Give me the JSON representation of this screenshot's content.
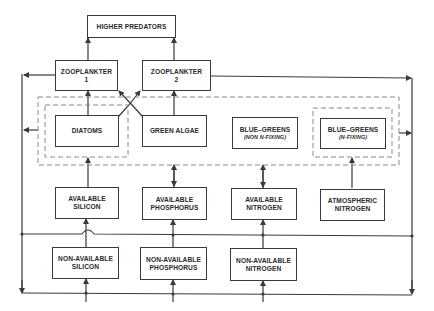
{
  "diagram": {
    "colors": {
      "line": "#3a3a3a",
      "dash": "#8a8a8a",
      "text": "#2a2a2a",
      "background": "#ffffff"
    },
    "nodes": {
      "higher_predators": {
        "label": "HIGHER PREDATORS"
      },
      "zooplankter_1": {
        "line1": "ZOOPLANKTER",
        "line2": "1"
      },
      "zooplankter_2": {
        "line1": "ZOOPLANKTER",
        "line2": "2"
      },
      "diatoms": {
        "label": "DIATOMS"
      },
      "green_algae": {
        "label": "GREEN ALGAE"
      },
      "blue_greens_non_fixing": {
        "line1": "BLUE–GREENS",
        "line2": "(NON N-FIXING)"
      },
      "blue_greens_fixing": {
        "line1": "BLUE–GREENS",
        "line2": "(N-FIXING)"
      },
      "available_silicon": {
        "line1": "AVAILABLE",
        "line2": "SILICON"
      },
      "available_phosphorus": {
        "line1": "AVAILABLE",
        "line2": "PHOSPHORUS"
      },
      "available_nitrogen": {
        "line1": "AVAILABLE",
        "line2": "NITROGEN"
      },
      "atmospheric_nitrogen": {
        "line1": "ATMOSPHERIC",
        "line2": "NITROGEN"
      },
      "non_available_silicon": {
        "line1": "NON-AVAILABLE",
        "line2": "SILICON"
      },
      "non_available_phosphorus": {
        "line1": "NON-AVAILABLE",
        "line2": "PHOSPHORUS"
      },
      "non_available_nitrogen": {
        "line1": "NON-AVAILABLE",
        "line2": "NITROGEN"
      }
    },
    "groups": [
      {
        "name": "phytoplankton-group",
        "members": [
          "diatoms",
          "green_algae",
          "blue_greens_non_fixing",
          "blue_greens_fixing"
        ]
      },
      {
        "name": "diatoms-subgroup",
        "members": [
          "diatoms"
        ]
      },
      {
        "name": "n-fixing-subgroup",
        "members": [
          "blue_greens_fixing"
        ]
      }
    ],
    "edges": [
      {
        "from": "zooplankter_1",
        "to": "higher_predators"
      },
      {
        "from": "zooplankter_2",
        "to": "higher_predators"
      },
      {
        "from": "diatoms",
        "to": "zooplankter_1"
      },
      {
        "from": "diatoms",
        "to": "zooplankter_2"
      },
      {
        "from": "green_algae",
        "to": "zooplankter_1"
      },
      {
        "from": "green_algae",
        "to": "zooplankter_2"
      },
      {
        "from": "available_silicon",
        "to": "diatoms"
      },
      {
        "from": "available_phosphorus",
        "to": "phytoplankton-group",
        "bidirectional": true
      },
      {
        "from": "available_nitrogen",
        "to": "phytoplankton-group",
        "bidirectional": true
      },
      {
        "from": "atmospheric_nitrogen",
        "to": "blue_greens_fixing"
      },
      {
        "from": "non_available_silicon",
        "to": "available_silicon"
      },
      {
        "from": "non_available_phosphorus",
        "to": "available_phosphorus"
      },
      {
        "from": "non_available_nitrogen",
        "to": "available_nitrogen"
      },
      {
        "from": "zooplankter_1",
        "to": "left-recycle-bus"
      },
      {
        "from": "phytoplankton-group",
        "to": "left-recycle-bus"
      },
      {
        "from": "zooplankter_2",
        "to": "right-recycle-bus"
      },
      {
        "from": "phytoplankton-group",
        "to": "right-recycle-bus"
      },
      {
        "from": "recycle-bus",
        "to": "non_available_silicon"
      },
      {
        "from": "recycle-bus",
        "to": "non_available_phosphorus"
      },
      {
        "from": "recycle-bus",
        "to": "non_available_nitrogen"
      }
    ]
  }
}
